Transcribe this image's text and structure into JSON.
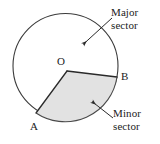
{
  "figure": {
    "type": "geometry-diagram",
    "canvas": {
      "width": 160,
      "height": 144,
      "background": "#ffffff"
    },
    "circle": {
      "center": {
        "x": 65.5,
        "y": 66
      },
      "radius": 52.5,
      "stroke": "#3b3b3b",
      "stroke_width": 1,
      "fill": "#ffffff"
    },
    "sector": {
      "name": "minor-sector-OAB",
      "vertex": {
        "x": 67,
        "y": 71
      },
      "point_a": {
        "x": 36,
        "y": 113
      },
      "point_b": {
        "x": 117,
        "y": 77
      },
      "fill": "#e2e2e2",
      "stroke": "#2a2a2a",
      "stroke_width": 1.2
    },
    "point_labels": {
      "center": "O",
      "a": "A",
      "b": "B"
    },
    "callouts": [
      {
        "id": "major",
        "line1": "Major",
        "line2": "sector",
        "arrow_from": {
          "x": 112,
          "y": 18
        },
        "arrow_to": {
          "x": 81,
          "y": 46
        }
      },
      {
        "id": "minor",
        "line1": "Minor",
        "line2": "sector",
        "arrow_from": {
          "x": 113,
          "y": 118
        },
        "arrow_to": {
          "x": 90,
          "y": 100
        }
      }
    ],
    "colors": {
      "ink": "#1b1b1b",
      "outline": "#3b3b3b",
      "shade": "#e2e2e2"
    }
  }
}
